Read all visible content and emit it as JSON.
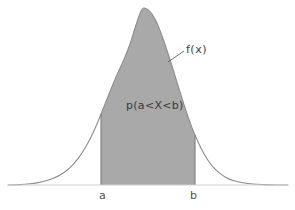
{
  "figure": {
    "kind": "probability-density-function-diagram",
    "background_color": "#ffffff",
    "curve_color": "#8c8c8c",
    "fill_color": "#a9a9a9",
    "axis_color": "#cfcfcf",
    "text_color": "#4a4a4a",
    "width": 295,
    "height": 210
  },
  "labels": {
    "density_function": "f(x)",
    "probability": "p(a<X<b)",
    "lower_bound": "a",
    "upper_bound": "b"
  },
  "chart_data": {
    "type": "area",
    "title": "",
    "subtitle": "",
    "xlabel": "",
    "ylabel": "",
    "grid": false,
    "legend": null,
    "axis": {
      "baseline_y_px": 185,
      "x_axis_start_px": 8,
      "x_axis_end_px": 288,
      "xlim_px": [
        8,
        288
      ],
      "ylim_px": [
        185,
        8
      ]
    },
    "annotations": [
      {
        "id": "density-callout",
        "text": "f(x)",
        "text_x_px": 186,
        "text_y_px": 50,
        "leader_from_px": [
          168,
          62
        ],
        "leader_to_px": [
          184,
          51
        ]
      },
      {
        "id": "shaded-area-label",
        "text": "p(a<X<b)",
        "text_x_px": 126,
        "text_y_px": 106
      }
    ],
    "bounds": {
      "a": {
        "label": "a",
        "x_px": 101,
        "tick_label_x_px": 99,
        "tick_label_y_px": 190
      },
      "b": {
        "label": "b",
        "x_px": 195,
        "tick_label_x_px": 190,
        "tick_label_y_px": 190
      }
    },
    "curve": {
      "description": "Unimodal bell-shaped probability density curve, slightly right-skewed with a rounded peak.",
      "peak_x_px": 143,
      "peak_y_px": 8,
      "tail_left_x_px": 22,
      "tail_right_x_px": 270,
      "points_px": [
        [
          8,
          185
        ],
        [
          20,
          184.6
        ],
        [
          30,
          183.8
        ],
        [
          38,
          182.6
        ],
        [
          46,
          180.8
        ],
        [
          54,
          178.0
        ],
        [
          60,
          175.0
        ],
        [
          66,
          171.0
        ],
        [
          72,
          165.6
        ],
        [
          78,
          158.6
        ],
        [
          84,
          149.8
        ],
        [
          90,
          139.0
        ],
        [
          96,
          126.2
        ],
        [
          101,
          114.0
        ],
        [
          106,
          101.6
        ],
        [
          112,
          86.6
        ],
        [
          118,
          72.4
        ],
        [
          124,
          59.4
        ],
        [
          130,
          44.0
        ],
        [
          136,
          25.0
        ],
        [
          141,
          11.0
        ],
        [
          144,
          8.0
        ],
        [
          148,
          9.6
        ],
        [
          152,
          14.0
        ],
        [
          156,
          21.0
        ],
        [
          160,
          30.4
        ],
        [
          164,
          41.4
        ],
        [
          168,
          53.4
        ],
        [
          172,
          66.0
        ],
        [
          176,
          79.0
        ],
        [
          180,
          92.0
        ],
        [
          184,
          104.6
        ],
        [
          188,
          116.6
        ],
        [
          192,
          127.6
        ],
        [
          195,
          135.0
        ],
        [
          199,
          144.0
        ],
        [
          203,
          152.0
        ],
        [
          208,
          160.2
        ],
        [
          213,
          166.8
        ],
        [
          219,
          172.6
        ],
        [
          226,
          177.4
        ],
        [
          234,
          180.8
        ],
        [
          243,
          182.8
        ],
        [
          253,
          184.0
        ],
        [
          264,
          184.6
        ],
        [
          276,
          185.0
        ],
        [
          288,
          185.0
        ]
      ],
      "shaded_region": {
        "from_label": "a",
        "to_label": "b",
        "from_x_px": 101,
        "to_x_px": 195,
        "meaning": "p(a<X<b)"
      }
    }
  }
}
